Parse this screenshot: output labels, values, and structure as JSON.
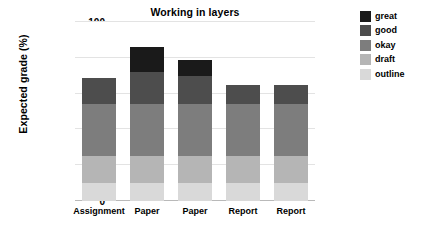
{
  "chart_data": {
    "type": "bar",
    "stacked": true,
    "title": "Working in layers",
    "xlabel": "",
    "ylabel": "Expected grade (%)",
    "categories": [
      "Assignment",
      "Paper",
      "Paper",
      "Report",
      "Report"
    ],
    "ylim": [
      0,
      100
    ],
    "yticks": [
      0,
      20,
      40,
      60,
      80,
      100
    ],
    "ytick_labels": [
      "0",
      "20",
      "40",
      "60",
      "80",
      "100"
    ],
    "grid": true,
    "grid_axis": "y",
    "legend_position": "upper right outside",
    "series": [
      {
        "name": "outline",
        "color": "#d9d9d9",
        "values": [
          10,
          10,
          10,
          10,
          10
        ]
      },
      {
        "name": "draft",
        "color": "#b5b5b5",
        "values": [
          15,
          15,
          15,
          15,
          15
        ]
      },
      {
        "name": "okay",
        "color": "#7d7d7d",
        "values": [
          29,
          29,
          29,
          29,
          29
        ]
      },
      {
        "name": "good",
        "color": "#4d4d4d",
        "values": [
          15,
          18,
          16,
          11,
          11
        ]
      },
      {
        "name": "great",
        "color": "#1a1a1a",
        "values": [
          0,
          14,
          9,
          0,
          0
        ]
      }
    ],
    "stack_order_bottom_to_top": [
      "outline",
      "draft",
      "okay",
      "good",
      "great"
    ],
    "legend_order_top_to_bottom": [
      "great",
      "good",
      "okay",
      "draft",
      "outline"
    ],
    "totals": [
      69,
      86,
      79,
      65,
      65
    ]
  },
  "legend": {
    "items": [
      {
        "label": "great",
        "color": "#1a1a1a"
      },
      {
        "label": "good",
        "color": "#4d4d4d"
      },
      {
        "label": "okay",
        "color": "#7d7d7d"
      },
      {
        "label": "draft",
        "color": "#b5b5b5"
      },
      {
        "label": "outline",
        "color": "#d9d9d9"
      }
    ]
  }
}
